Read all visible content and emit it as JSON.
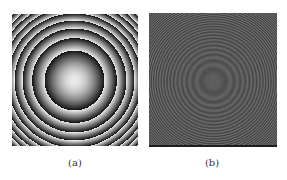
{
  "figure": {
    "panels": [
      {
        "id": "a",
        "caption": "(a)",
        "kind": "wrapped-phase",
        "box": {
          "x": 12,
          "y": 14,
          "w": 126,
          "h": 132
        },
        "center": {
          "x": 62,
          "y": 66
        },
        "first_zone_radius": 30,
        "bright": 235,
        "dark": 15,
        "caption_pos": {
          "x": 75,
          "y": 157
        }
      },
      {
        "id": "b",
        "caption": "(b)",
        "kind": "interference-fringes",
        "box": {
          "x": 149,
          "y": 13,
          "w": 128,
          "h": 134
        },
        "center": {
          "x": 64,
          "y": 68
        },
        "first_ring_radius": 12,
        "base_gray": 88,
        "contrast_center": 6,
        "contrast_edge": 28,
        "caption_pos": {
          "x": 212,
          "y": 157
        }
      }
    ]
  }
}
